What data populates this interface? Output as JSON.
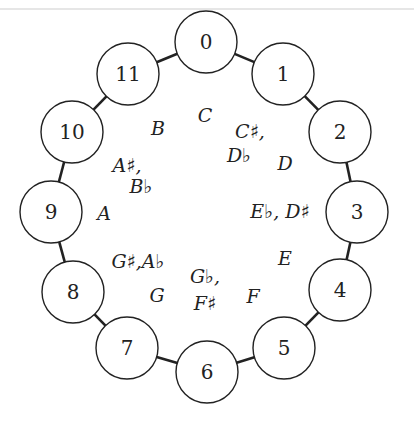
{
  "diagram": {
    "title": "",
    "center": {
      "x": 206,
      "y": 208
    },
    "radius": 162,
    "node_radius": 31,
    "stroke_color": "#222222",
    "nodes": [
      {
        "id": "0",
        "x": 206,
        "y": 42
      },
      {
        "id": "1",
        "x": 283,
        "y": 74
      },
      {
        "id": "2",
        "x": 340,
        "y": 132
      },
      {
        "id": "3",
        "x": 357,
        "y": 212
      },
      {
        "id": "4",
        "x": 340,
        "y": 290
      },
      {
        "id": "5",
        "x": 284,
        "y": 348
      },
      {
        "id": "6",
        "x": 207,
        "y": 372
      },
      {
        "id": "7",
        "x": 127,
        "y": 348
      },
      {
        "id": "8",
        "x": 73,
        "y": 292
      },
      {
        "id": "9",
        "x": 51,
        "y": 212
      },
      {
        "id": "10",
        "x": 72,
        "y": 132
      },
      {
        "id": "11",
        "x": 128,
        "y": 74
      }
    ],
    "notes": [
      {
        "pc": 0,
        "text": "C",
        "x": 205,
        "y": 122
      },
      {
        "pc": 1,
        "text": "C♯,",
        "x": 250,
        "y": 138
      },
      {
        "pc": 1,
        "text": "D♭",
        "x": 239,
        "y": 162
      },
      {
        "pc": 2,
        "text": "D",
        "x": 285,
        "y": 170
      },
      {
        "pc": 3,
        "text": "E♭, D♯",
        "x": 280,
        "y": 218
      },
      {
        "pc": 4,
        "text": "E",
        "x": 285,
        "y": 265
      },
      {
        "pc": 5,
        "text": "F",
        "x": 253,
        "y": 303
      },
      {
        "pc": 6,
        "text": "G♭,",
        "x": 205,
        "y": 283
      },
      {
        "pc": 6,
        "text": "F♯",
        "x": 205,
        "y": 310
      },
      {
        "pc": 7,
        "text": "G",
        "x": 157,
        "y": 302
      },
      {
        "pc": 8,
        "text": "G♯,A♭",
        "x": 138,
        "y": 268
      },
      {
        "pc": 9,
        "text": "A",
        "x": 104,
        "y": 220
      },
      {
        "pc": 10,
        "text": "A♯,",
        "x": 127,
        "y": 172
      },
      {
        "pc": 10,
        "text": "B♭",
        "x": 141,
        "y": 193
      },
      {
        "pc": 11,
        "text": "B",
        "x": 158,
        "y": 135
      }
    ]
  }
}
